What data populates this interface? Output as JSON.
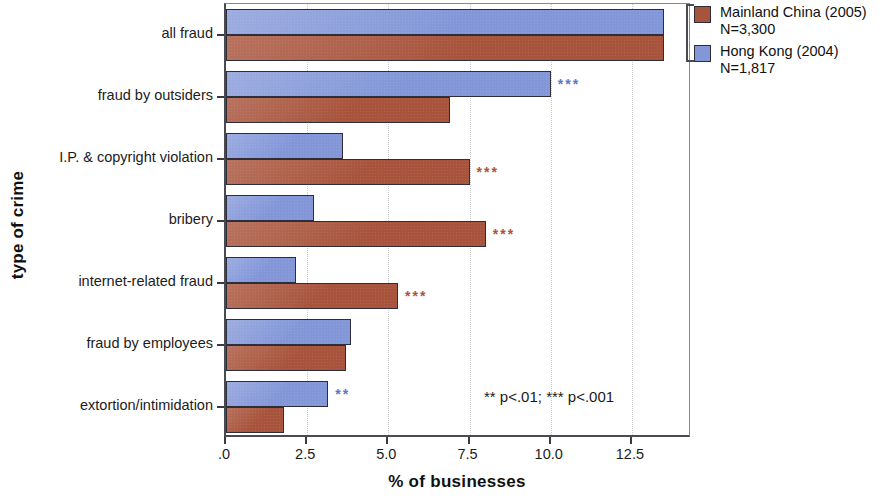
{
  "chart_data": {
    "type": "bar",
    "orientation": "horizontal",
    "title": "",
    "xlabel": "% of businesses",
    "ylabel": "type of crime",
    "xlim": [
      0,
      14.35
    ],
    "xticks": [
      0,
      2.5,
      5.0,
      7.5,
      10.0,
      12.5
    ],
    "xticklabels": [
      ".0",
      "2.5",
      "5.0",
      "7.5",
      "10.0",
      "12.5"
    ],
    "grid": true,
    "legend_position": "right",
    "categories": [
      "all fraud",
      "fraud by outsiders",
      "I.P. & copyright violation",
      "bribery",
      "internet-related fraud",
      "fraud by employees",
      "extortion/intimidation"
    ],
    "series": [
      {
        "name": "Hong Kong (2004)",
        "subtitle": "N=1,817",
        "color": "#8296d8",
        "values": [
          13.5,
          10.0,
          3.6,
          2.7,
          2.15,
          3.85,
          3.15
        ],
        "significance": [
          "",
          "***",
          "",
          "",
          "",
          "",
          "**"
        ]
      },
      {
        "name": "Mainland China (2005)",
        "subtitle": "N=3,300",
        "color": "#a8543c",
        "values": [
          13.5,
          6.9,
          7.5,
          8.0,
          5.3,
          3.7,
          1.8
        ],
        "significance": [
          "",
          "",
          "***",
          "***",
          "***",
          "",
          ""
        ]
      }
    ],
    "annotation": "**  p<.01;  ***  p<.001"
  },
  "legend": {
    "entries": [
      {
        "label": "Mainland China (2005)",
        "n": "N=3,300",
        "swatch": "red"
      },
      {
        "label": "Hong Kong (2004)",
        "n": "N=1,817",
        "swatch": "blue"
      }
    ]
  }
}
